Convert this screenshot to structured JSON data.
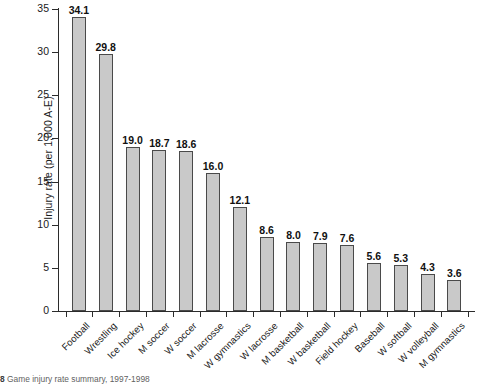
{
  "chart_data": {
    "type": "bar",
    "title": "",
    "xlabel": "",
    "ylabel": "Injury rate (per 1,000 A-E)",
    "ylim": [
      0,
      35
    ],
    "ytick_step": 5,
    "yticks": [
      0,
      5,
      10,
      15,
      20,
      25,
      30,
      35
    ],
    "grid": false,
    "legend": "none",
    "bar_color": "#c9c9c9",
    "bar_edge_color": "#4a4a4a",
    "value_label_format": "one-decimal",
    "categories": [
      "Football",
      "Wrestling",
      "Ice hockey",
      "M soccer",
      "W soccer",
      "M lacrosse",
      "W gymnastics",
      "W lacrosse",
      "M basketball",
      "W basketball",
      "Field hockey",
      "Baseball",
      "W softball",
      "W volleyball",
      "M gymnastics"
    ],
    "values": [
      34.1,
      29.8,
      19.0,
      18.7,
      18.6,
      16.0,
      12.1,
      8.6,
      8.0,
      7.9,
      7.6,
      5.6,
      5.3,
      4.3,
      3.6
    ]
  },
  "caption": {
    "number": "8",
    "text": "Game injury rate summary, 1997-1998"
  }
}
